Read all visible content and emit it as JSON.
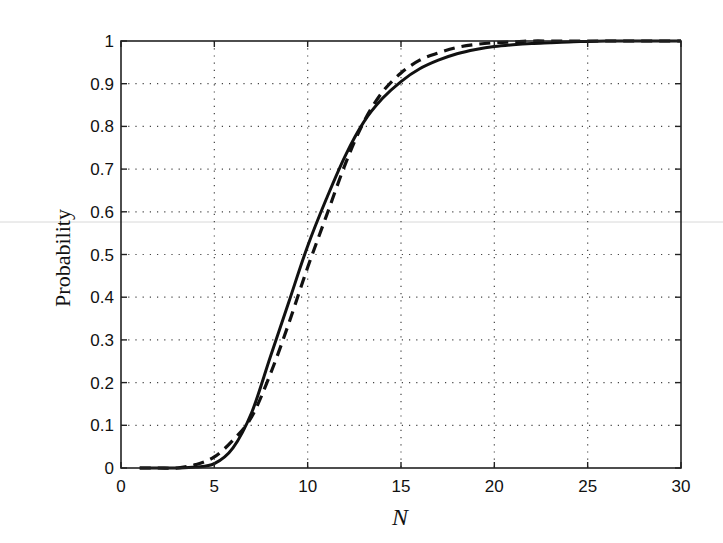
{
  "chart_data": {
    "type": "line",
    "title": "",
    "xlabel": "N",
    "ylabel": "Probability",
    "xlim": [
      0,
      30
    ],
    "ylim": [
      0,
      1
    ],
    "grid": true,
    "legend": null,
    "x_ticks": [
      0,
      5,
      10,
      15,
      20,
      25,
      30
    ],
    "x_tick_labels": [
      "0",
      "5",
      "10",
      "15",
      "20",
      "25",
      "30"
    ],
    "y_ticks": [
      0,
      0.1,
      0.2,
      0.3,
      0.4,
      0.5,
      0.6,
      0.7,
      0.8,
      0.9,
      1
    ],
    "y_tick_labels": [
      "0",
      "0.1",
      "0.2",
      "0.3",
      "0.4",
      "0.5",
      "0.6",
      "0.7",
      "0.8",
      "0.9",
      "1"
    ],
    "x": [
      1,
      2,
      3,
      4,
      5,
      6,
      7,
      8,
      9,
      10,
      11,
      12,
      13,
      14,
      15,
      16,
      17,
      18,
      19,
      20,
      21,
      22,
      23,
      24,
      25,
      26,
      27,
      28,
      29,
      30
    ],
    "series": [
      {
        "name": "solid",
        "style": "solid",
        "color": "#111111",
        "values": [
          0.0,
          0.0,
          0.0,
          0.002,
          0.01,
          0.047,
          0.13,
          0.26,
          0.39,
          0.52,
          0.63,
          0.73,
          0.81,
          0.865,
          0.905,
          0.935,
          0.955,
          0.97,
          0.98,
          0.987,
          0.991,
          0.994,
          0.996,
          0.998,
          0.999,
          1.0,
          1.0,
          1.0,
          1.0,
          1.0
        ]
      },
      {
        "name": "dashed",
        "style": "dashed",
        "color": "#111111",
        "values": [
          0.0,
          0.0,
          0.0,
          0.008,
          0.026,
          0.065,
          0.12,
          0.22,
          0.34,
          0.47,
          0.59,
          0.71,
          0.81,
          0.88,
          0.925,
          0.955,
          0.972,
          0.985,
          0.992,
          0.996,
          0.998,
          1.0,
          1.0,
          1.0,
          1.0,
          1.0,
          1.0,
          1.0,
          1.0,
          1.0
        ]
      }
    ]
  },
  "axes": {
    "x_title": "N",
    "y_title": "Probability"
  }
}
